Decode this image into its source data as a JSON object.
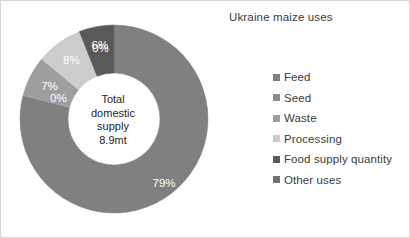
{
  "chart_data": {
    "type": "pie",
    "variant": "donut",
    "title": "Ukraine maize uses",
    "xlabel": "",
    "ylabel": "",
    "legend_position": "right",
    "grid": false,
    "center_label_lines": [
      "Total",
      "domestic",
      "supply",
      "8.9mt"
    ],
    "categories": [
      "Feed",
      "Seed",
      "Waste",
      "Processing",
      "Food supply quantity",
      "Other uses"
    ],
    "values": [
      79,
      0,
      7,
      8,
      6,
      0
    ],
    "data_labels": [
      "79%",
      "0%",
      "7%",
      "8%",
      "6%",
      "0%"
    ],
    "colors": [
      "#808080",
      "#8c8c8c",
      "#9e9e9e",
      "#cccccc",
      "#595959",
      "#737373"
    ],
    "slices": [
      {
        "label": "Feed",
        "value": 79,
        "data_label": "79%",
        "color": "#808080"
      },
      {
        "label": "Seed",
        "value": 0,
        "data_label": "0%",
        "color": "#8c8c8c"
      },
      {
        "label": "Waste",
        "value": 7,
        "data_label": "7%",
        "color": "#9e9e9e"
      },
      {
        "label": "Processing",
        "value": 8,
        "data_label": "8%",
        "color": "#cccccc"
      },
      {
        "label": "Food supply quantity",
        "value": 6,
        "data_label": "6%",
        "color": "#595959"
      },
      {
        "label": "Other uses",
        "value": 0,
        "data_label": "0%",
        "color": "#737373"
      }
    ]
  },
  "center": {
    "line1": "Total",
    "line2": "domestic",
    "line3": "supply",
    "line4": "8.9mt"
  },
  "labels": {
    "feed": "79%",
    "seed": "0%",
    "waste": "7%",
    "processing": "8%",
    "food_supply_quantity": "6%",
    "other_uses": "0%"
  },
  "legend": {
    "items": [
      {
        "label": "Feed",
        "color": "#808080"
      },
      {
        "label": "Seed",
        "color": "#8c8c8c"
      },
      {
        "label": "Waste",
        "color": "#9e9e9e"
      },
      {
        "label": "Processing",
        "color": "#cccccc"
      },
      {
        "label": "Food supply quantity",
        "color": "#595959"
      },
      {
        "label": "Other uses",
        "color": "#737373"
      }
    ]
  },
  "title": "Ukraine maize uses"
}
